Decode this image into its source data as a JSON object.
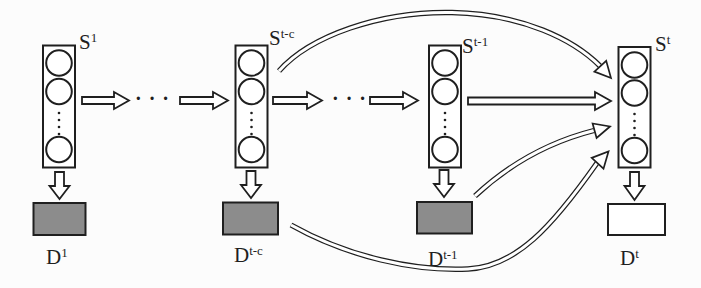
{
  "colors": {
    "ink": "#1f1f1f",
    "node_fill": "#8c8c8c",
    "empty_fill": "#ffffff",
    "background": "#fcfcfc"
  },
  "labels": {
    "s1": {
      "base": "S",
      "sup": "1"
    },
    "s_tc": {
      "base": "S",
      "sup": "t-c"
    },
    "s_t1": {
      "base": "S",
      "sup": "t-1"
    },
    "s_t": {
      "base": "S",
      "sup": "t"
    },
    "d1": {
      "base": "D",
      "sup": "1"
    },
    "d_tc": {
      "base": "D",
      "sup": "t-c"
    },
    "d_t1": {
      "base": "D",
      "sup": "t-1"
    },
    "d_t": {
      "base": "D",
      "sup": "t"
    }
  },
  "ellipsis": "· · ·"
}
